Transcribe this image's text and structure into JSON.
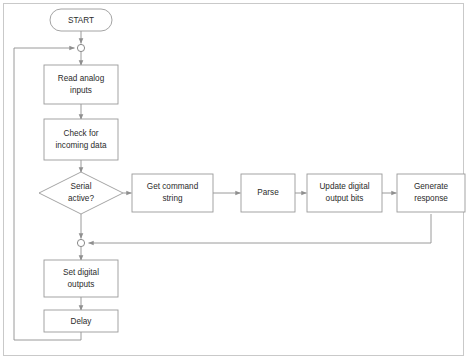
{
  "diagram": {
    "frame": {
      "visible": true,
      "color": "#c9c9c9"
    },
    "style": {
      "shape_stroke": "#9a9a9a",
      "shape_fill": "#ffffff",
      "edge_stroke": "#8f8f8f",
      "text_color": "#2b2b2b",
      "background": "#ffffff"
    },
    "nodes": {
      "start": {
        "label": "START",
        "shape": "terminator"
      },
      "read_analog": {
        "label_line1": "Read analog",
        "label_line2": "inputs",
        "shape": "process"
      },
      "check_incoming": {
        "label_line1": "Check for",
        "label_line2": "incoming data",
        "shape": "process"
      },
      "serial_active": {
        "label_line1": "Serial",
        "label_line2": "active?",
        "shape": "decision"
      },
      "get_command": {
        "label_line1": "Get command",
        "label_line2": "string",
        "shape": "process"
      },
      "parse": {
        "label_line1": "Parse",
        "label_line2": "",
        "shape": "process"
      },
      "update_bits": {
        "label_line1": "Update digital",
        "label_line2": "output bits",
        "shape": "process"
      },
      "generate_response": {
        "label_line1": "Generate",
        "label_line2": "response",
        "shape": "process"
      },
      "set_outputs": {
        "label_line1": "Set digital",
        "label_line2": "outputs",
        "shape": "process"
      },
      "delay": {
        "label_line1": "Delay",
        "label_line2": "",
        "shape": "process"
      }
    },
    "junctions": {
      "top_merge": {
        "name": "top-loop-merge"
      },
      "bottom_merge": {
        "name": "serial-branch-merge"
      }
    }
  }
}
